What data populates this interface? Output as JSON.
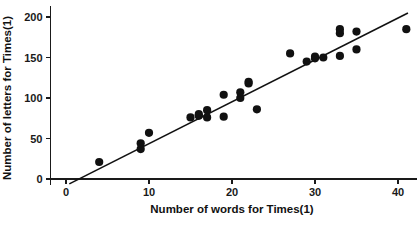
{
  "chart_data": {
    "type": "scatter",
    "title": "",
    "xlabel": "Number of words for Times(1)",
    "ylabel": "Number of letters for Times(1)",
    "xlim": [
      -1.8,
      42.5
    ],
    "ylim": [
      -14,
      212
    ],
    "xticks": [
      0,
      10,
      20,
      30,
      40
    ],
    "xticklabels": [
      "0",
      "10",
      "20",
      "30",
      "40"
    ],
    "yticks": [
      0,
      50,
      100,
      150,
      200
    ],
    "yticklabels": [
      "0",
      "50",
      "100",
      "150",
      "200"
    ],
    "grid": false,
    "legend": null,
    "marker_color": "#111111",
    "line_color": "#111111",
    "axis_color": "#1a1a1a",
    "marker_size": 4.1,
    "series": [
      {
        "name": "Times(1) words vs letters",
        "type": "scatter",
        "points": [
          [
            4,
            21
          ],
          [
            9,
            37
          ],
          [
            9,
            44
          ],
          [
            10,
            57
          ],
          [
            15,
            76
          ],
          [
            16,
            78
          ],
          [
            16,
            80
          ],
          [
            17,
            85
          ],
          [
            17,
            76
          ],
          [
            19,
            104
          ],
          [
            19,
            77
          ],
          [
            21,
            100
          ],
          [
            21,
            107
          ],
          [
            22,
            118
          ],
          [
            22,
            120
          ],
          [
            23,
            86
          ],
          [
            27,
            155
          ],
          [
            29,
            145
          ],
          [
            30,
            149
          ],
          [
            30,
            151
          ],
          [
            31,
            150
          ],
          [
            33,
            180
          ],
          [
            33,
            185
          ],
          [
            33,
            152
          ],
          [
            35,
            160
          ],
          [
            35,
            182
          ],
          [
            41,
            185
          ]
        ]
      },
      {
        "name": "fitted regression line",
        "type": "line",
        "endpoints": [
          [
            0.4,
            -6
          ],
          [
            41.2,
            205
          ]
        ]
      }
    ]
  }
}
